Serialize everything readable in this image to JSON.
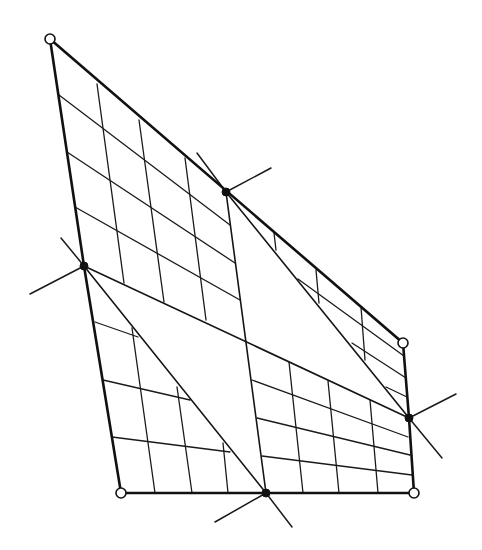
{
  "diagram": {
    "type": "quadrilateral mesh partition",
    "colors": {
      "line": "#111111",
      "background": "#ffffff"
    },
    "boundary": [
      [
        50,
        39
      ],
      [
        403,
        343
      ],
      [
        409,
        418
      ],
      [
        414,
        493
      ],
      [
        121,
        493
      ],
      [
        84,
        266
      ]
    ],
    "corner_nodes_open": [
      [
        50,
        39
      ],
      [
        403,
        343
      ],
      [
        414,
        493
      ],
      [
        121,
        493
      ]
    ],
    "split_nodes_solid": [
      [
        226,
        192
      ],
      [
        84,
        266
      ],
      [
        409,
        418
      ],
      [
        266,
        493
      ]
    ],
    "partition_lines": [
      [
        [
          226,
          192
        ],
        [
          266,
          493
        ]
      ],
      [
        [
          84,
          266
        ],
        [
          409,
          418
        ]
      ],
      [
        [
          226,
          192
        ],
        [
          409,
          418
        ]
      ],
      [
        [
          84,
          266
        ],
        [
          266,
          493
        ]
      ]
    ],
    "spikes": [
      [
        [
          197,
          153
        ],
        [
          226,
          192
        ]
      ],
      [
        [
          226,
          192
        ],
        [
          271,
          168
        ]
      ],
      [
        [
          61,
          238
        ],
        [
          84,
          266
        ]
      ],
      [
        [
          84,
          266
        ],
        [
          30,
          294
        ]
      ],
      [
        [
          409,
          418
        ],
        [
          456,
          394
        ]
      ],
      [
        [
          409,
          418
        ],
        [
          442,
          458
        ]
      ],
      [
        [
          266,
          493
        ],
        [
          215,
          522
        ]
      ],
      [
        [
          266,
          493
        ],
        [
          292,
          527
        ]
      ]
    ],
    "grid_lines": {
      "upper_left_block": [
        [
          [
            97,
            84
          ],
          [
            124,
            283
          ]
        ],
        [
          [
            139,
            120
          ],
          [
            164,
            302
          ]
        ],
        [
          [
            185,
            158
          ],
          [
            206,
            320
          ]
        ],
        [
          [
            59,
            95
          ],
          [
            230,
            225
          ]
        ],
        [
          [
            67,
            152
          ],
          [
            235,
            263
          ]
        ],
        [
          [
            75,
            207
          ],
          [
            240,
            300
          ]
        ]
      ],
      "upper_right_block": [
        [
          [
            274,
            233
          ],
          [
            276,
            250
          ]
        ],
        [
          [
            316,
            270
          ],
          [
            319,
            303
          ]
        ],
        [
          [
            361,
            307
          ],
          [
            365,
            360
          ]
        ],
        [
          [
            298,
            279
          ],
          [
            404,
            356
          ]
        ],
        [
          [
            352,
            343
          ],
          [
            406,
            378
          ]
        ],
        [
          [
            386,
            387
          ],
          [
            407,
            397
          ]
        ]
      ],
      "lower_left_block": [
        [
          [
            132,
            328
          ],
          [
            155,
            493
          ]
        ],
        [
          [
            177,
            387
          ],
          [
            192,
            493
          ]
        ],
        [
          [
            223,
            443
          ],
          [
            228,
            493
          ]
        ],
        [
          [
            95,
            322
          ],
          [
            138,
            337
          ]
        ],
        [
          [
            103,
            380
          ],
          [
            190,
            400
          ]
        ],
        [
          [
            112,
            437
          ],
          [
            230,
            452
          ]
        ]
      ],
      "lower_right_block": [
        [
          [
            289,
            362
          ],
          [
            303,
            493
          ]
        ],
        [
          [
            328,
            381
          ],
          [
            339,
            493
          ]
        ],
        [
          [
            370,
            400
          ],
          [
            378,
            493
          ]
        ],
        [
          [
            252,
            380
          ],
          [
            408,
            437
          ]
        ],
        [
          [
            257,
            418
          ],
          [
            410,
            455
          ]
        ],
        [
          [
            262,
            456
          ],
          [
            412,
            475
          ]
        ]
      ]
    }
  }
}
